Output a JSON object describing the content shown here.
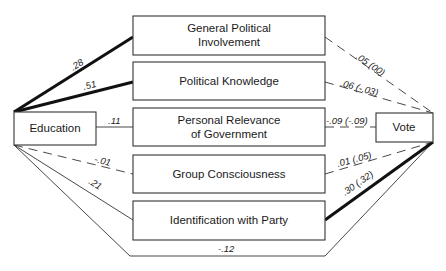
{
  "diagram": {
    "type": "path-diagram",
    "source_node": {
      "id": "education",
      "label": "Education"
    },
    "outcome_node": {
      "id": "vote",
      "label": "Vote"
    },
    "mediators": [
      {
        "id": "general-political-involvement",
        "label_line1": "General Political",
        "label_line2": "Involvement"
      },
      {
        "id": "political-knowledge",
        "label_line1": "Political Knowledge",
        "label_line2": ""
      },
      {
        "id": "personal-relevance-of-government",
        "label_line1": "Personal Relevance",
        "label_line2": "of Government"
      },
      {
        "id": "group-consciousness",
        "label_line1": "Group Consciousness",
        "label_line2": ""
      },
      {
        "id": "identification-with-party",
        "label_line1": "Identification with Party",
        "label_line2": ""
      }
    ],
    "paths": [
      {
        "from": "education",
        "to": "general-political-involvement",
        "coef": ".28",
        "style": "thick"
      },
      {
        "from": "education",
        "to": "political-knowledge",
        "coef": ".51",
        "style": "thick"
      },
      {
        "from": "education",
        "to": "personal-relevance-of-government",
        "coef": ".11",
        "style": "thin"
      },
      {
        "from": "education",
        "to": "group-consciousness",
        "coef": "-.01",
        "style": "dashed"
      },
      {
        "from": "education",
        "to": "identification-with-party",
        "coef": ".21",
        "style": "thin"
      },
      {
        "from": "general-political-involvement",
        "to": "vote",
        "coef": ".05 (00)",
        "style": "dashed"
      },
      {
        "from": "political-knowledge",
        "to": "vote",
        "coef": ".06 (-.03)",
        "style": "dashed"
      },
      {
        "from": "personal-relevance-of-government",
        "to": "vote",
        "coef": "-.09 (-.09)",
        "style": "dashed"
      },
      {
        "from": "group-consciousness",
        "to": "vote",
        "coef": ".01 (.05)",
        "style": "dashed"
      },
      {
        "from": "identification-with-party",
        "to": "vote",
        "coef": ".30 (.32)",
        "style": "thick"
      },
      {
        "from": "education",
        "to": "vote",
        "coef": "-.12",
        "style": "thin"
      }
    ]
  }
}
